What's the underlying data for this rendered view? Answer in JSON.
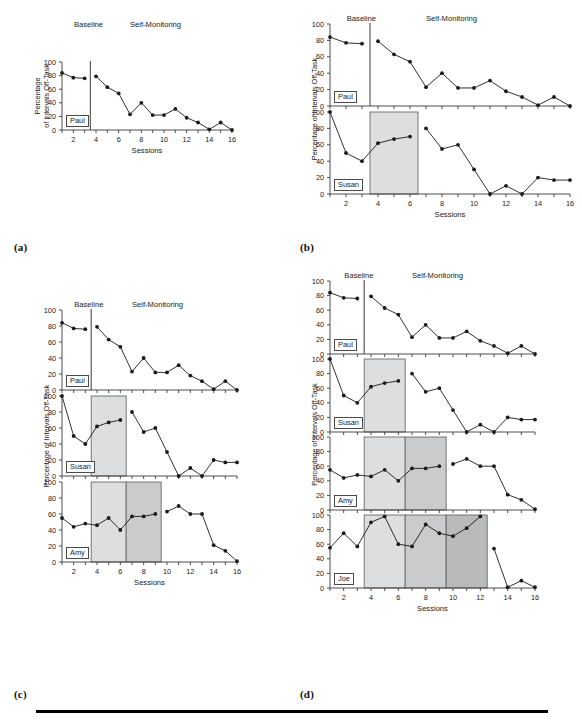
{
  "figure": {
    "axis_label_y": "Percentage of Intervals Off-Task",
    "axis_label_y_line1": "Percentage",
    "axis_label_y_line2": "of Intervals Off-Task",
    "axis_label_x": "Sessions",
    "phase_baseline": "Baseline",
    "phase_treatment": "Self-Monitoring",
    "colors": {
      "line": "#1a1a1a",
      "marker": "#1a1a1a",
      "axis": "#3a3a3a",
      "shade_light": "#dcdedf",
      "shade_medium": "#c9cbcc",
      "shade_dark": "#b8babb",
      "shade_border": "#5a5a5a",
      "background": "#ffffff",
      "rule": "#000000"
    },
    "y_axis": {
      "min": 0,
      "max": 100,
      "ticks": [
        0,
        20,
        40,
        60,
        80,
        100
      ]
    },
    "x_axis": {
      "min": 1,
      "max": 16,
      "ticks": [
        1,
        2,
        3,
        4,
        5,
        6,
        7,
        8,
        9,
        10,
        11,
        12,
        13,
        14,
        15,
        16
      ],
      "labeled_ticks": [
        2,
        4,
        6,
        8,
        10,
        12,
        14,
        16
      ]
    }
  },
  "panels": [
    {
      "letter": "(a)",
      "name": "panel-a",
      "y_label_style": "two-line",
      "subjects": [
        {
          "name": "Paul",
          "baseline_break_x": 3.5,
          "shades": [],
          "segments": [
            {
              "x": [
                1,
                2,
                3
              ],
              "y": [
                84,
                77,
                76
              ]
            },
            {
              "x": [
                4,
                5,
                6,
                7,
                8,
                9,
                10,
                11,
                12,
                13,
                14,
                15,
                16
              ],
              "y": [
                79,
                63,
                54,
                23,
                40,
                22,
                22,
                31,
                18,
                11,
                1,
                11,
                0
              ]
            }
          ]
        }
      ]
    },
    {
      "letter": "(b)",
      "name": "panel-b",
      "y_label_style": "one-line",
      "subjects": [
        {
          "name": "Paul",
          "baseline_break_x": 3.5,
          "shades": [],
          "segments": [
            {
              "x": [
                1,
                2,
                3
              ],
              "y": [
                84,
                77,
                76
              ]
            },
            {
              "x": [
                4,
                5,
                6,
                7,
                8,
                9,
                10,
                11,
                12,
                13,
                14,
                15,
                16
              ],
              "y": [
                79,
                63,
                54,
                23,
                40,
                22,
                22,
                31,
                18,
                11,
                1,
                11,
                0
              ]
            }
          ]
        },
        {
          "name": "Susan",
          "baseline_break_x": null,
          "shades": [
            {
              "x0": 3.5,
              "x1": 6.5,
              "level": "light"
            }
          ],
          "segments": [
            {
              "x": [
                1,
                2,
                3,
                4,
                5,
                6
              ],
              "y": [
                100,
                50,
                40,
                62,
                67,
                70
              ]
            },
            {
              "x": [
                7,
                8,
                9,
                10,
                11,
                12,
                13,
                14,
                15,
                16
              ],
              "y": [
                80,
                55,
                60,
                30,
                0,
                10,
                0,
                20,
                17,
                17
              ]
            }
          ]
        }
      ]
    },
    {
      "letter": "(c)",
      "name": "panel-c",
      "y_label_style": "one-line",
      "subjects": [
        {
          "name": "Paul",
          "baseline_break_x": 3.5,
          "shades": [],
          "segments": [
            {
              "x": [
                1,
                2,
                3
              ],
              "y": [
                84,
                77,
                76
              ]
            },
            {
              "x": [
                4,
                5,
                6,
                7,
                8,
                9,
                10,
                11,
                12,
                13,
                14,
                15,
                16
              ],
              "y": [
                79,
                63,
                54,
                23,
                40,
                22,
                22,
                31,
                18,
                11,
                1,
                11,
                0
              ]
            }
          ]
        },
        {
          "name": "Susan",
          "baseline_break_x": null,
          "shades": [
            {
              "x0": 3.5,
              "x1": 6.5,
              "level": "light"
            }
          ],
          "segments": [
            {
              "x": [
                1,
                2,
                3,
                4,
                5,
                6
              ],
              "y": [
                100,
                50,
                40,
                62,
                67,
                70
              ]
            },
            {
              "x": [
                7,
                8,
                9,
                10,
                11,
                12,
                13,
                14,
                15,
                16
              ],
              "y": [
                80,
                55,
                60,
                30,
                0,
                10,
                0,
                20,
                17,
                17
              ]
            }
          ]
        },
        {
          "name": "Amy",
          "baseline_break_x": null,
          "shades": [
            {
              "x0": 3.5,
              "x1": 6.5,
              "level": "light"
            },
            {
              "x0": 6.5,
              "x1": 9.5,
              "level": "medium"
            }
          ],
          "segments": [
            {
              "x": [
                1,
                2,
                3,
                4,
                5,
                6,
                7,
                8,
                9
              ],
              "y": [
                55,
                44,
                48,
                46,
                55,
                40,
                57,
                57,
                60
              ]
            },
            {
              "x": [
                10,
                11,
                12,
                13,
                14,
                15,
                16
              ],
              "y": [
                63,
                70,
                60,
                60,
                21,
                14,
                1
              ]
            }
          ]
        }
      ]
    },
    {
      "letter": "(d)",
      "name": "panel-d",
      "y_label_style": "one-line",
      "subjects": [
        {
          "name": "Paul",
          "baseline_break_x": 3.5,
          "shades": [],
          "segments": [
            {
              "x": [
                1,
                2,
                3
              ],
              "y": [
                84,
                77,
                76
              ]
            },
            {
              "x": [
                4,
                5,
                6,
                7,
                8,
                9,
                10,
                11,
                12,
                13,
                14,
                15,
                16
              ],
              "y": [
                79,
                63,
                54,
                23,
                40,
                22,
                22,
                31,
                18,
                11,
                1,
                11,
                0
              ]
            }
          ]
        },
        {
          "name": "Susan",
          "baseline_break_x": null,
          "shades": [
            {
              "x0": 3.5,
              "x1": 6.5,
              "level": "light"
            }
          ],
          "segments": [
            {
              "x": [
                1,
                2,
                3,
                4,
                5,
                6
              ],
              "y": [
                100,
                50,
                40,
                62,
                67,
                70
              ]
            },
            {
              "x": [
                7,
                8,
                9,
                10,
                11,
                12,
                13,
                14,
                15,
                16
              ],
              "y": [
                80,
                55,
                60,
                30,
                0,
                10,
                0,
                20,
                17,
                17
              ]
            }
          ]
        },
        {
          "name": "Amy",
          "baseline_break_x": null,
          "shades": [
            {
              "x0": 3.5,
              "x1": 6.5,
              "level": "light"
            },
            {
              "x0": 6.5,
              "x1": 9.5,
              "level": "medium"
            }
          ],
          "segments": [
            {
              "x": [
                1,
                2,
                3,
                4,
                5,
                6,
                7,
                8,
                9
              ],
              "y": [
                55,
                44,
                48,
                46,
                55,
                40,
                57,
                57,
                60
              ]
            },
            {
              "x": [
                10,
                11,
                12,
                13,
                14,
                15,
                16
              ],
              "y": [
                63,
                70,
                60,
                60,
                21,
                14,
                1
              ]
            }
          ]
        },
        {
          "name": "Joe",
          "baseline_break_x": null,
          "shades": [
            {
              "x0": 3.5,
              "x1": 6.5,
              "level": "light"
            },
            {
              "x0": 6.5,
              "x1": 9.5,
              "level": "medium"
            },
            {
              "x0": 9.5,
              "x1": 12.5,
              "level": "dark"
            }
          ],
          "segments": [
            {
              "x": [
                1,
                2,
                3,
                4,
                5,
                6,
                7,
                8,
                9,
                10,
                11,
                12
              ],
              "y": [
                55,
                75,
                57,
                90,
                98,
                60,
                57,
                87,
                75,
                71,
                82,
                98
              ]
            },
            {
              "x": [
                13,
                14,
                15,
                16
              ],
              "y": [
                54,
                1,
                10,
                1
              ]
            }
          ]
        }
      ]
    }
  ],
  "chart_data": {
    "type": "line",
    "title": "",
    "xlabel": "Sessions",
    "ylabel": "Percentage of Intervals Off-Task",
    "xlim": [
      1,
      16
    ],
    "ylim": [
      0,
      100
    ],
    "grid": false,
    "legend": "none",
    "x": [
      1,
      2,
      3,
      4,
      5,
      6,
      7,
      8,
      9,
      10,
      11,
      12,
      13,
      14,
      15,
      16
    ],
    "series": [
      {
        "name": "Paul",
        "values": [
          84,
          77,
          76,
          79,
          63,
          54,
          23,
          40,
          22,
          22,
          31,
          18,
          11,
          1,
          11,
          0
        ],
        "intervention_start": 4
      },
      {
        "name": "Susan",
        "values": [
          100,
          50,
          40,
          62,
          67,
          70,
          80,
          55,
          60,
          30,
          0,
          10,
          0,
          20,
          17,
          17
        ],
        "intervention_start": 7
      },
      {
        "name": "Amy",
        "values": [
          55,
          44,
          48,
          46,
          55,
          40,
          57,
          57,
          60,
          63,
          70,
          60,
          60,
          21,
          14,
          1
        ],
        "intervention_start": 10
      },
      {
        "name": "Joe",
        "values": [
          55,
          75,
          57,
          90,
          98,
          60,
          57,
          87,
          75,
          71,
          82,
          98,
          54,
          1,
          10,
          1
        ],
        "intervention_start": 13
      }
    ],
    "annotations": [
      {
        "text": "Baseline",
        "role": "phase-label"
      },
      {
        "text": "Self-Monitoring",
        "role": "phase-label"
      }
    ],
    "panels": [
      "(a)",
      "(b)",
      "(c)",
      "(d)"
    ]
  }
}
